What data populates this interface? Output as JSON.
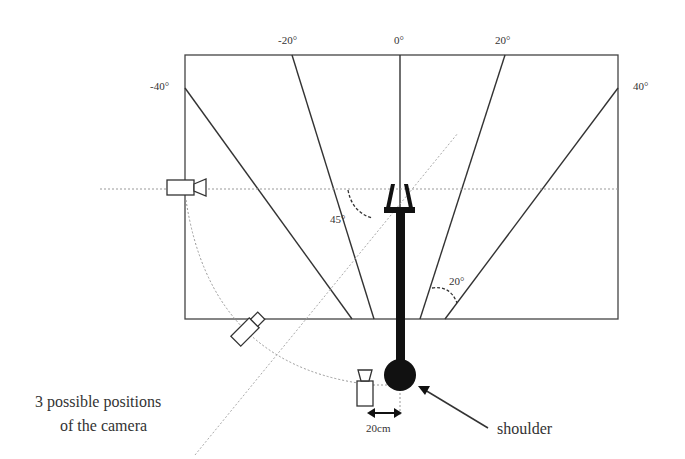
{
  "figure": {
    "angle_labels": {
      "minus40": "-40°",
      "minus20": "-20°",
      "zero": "0°",
      "plus20": "20°",
      "plus40": "40°"
    },
    "angle_annotations": {
      "camera_axis": "45°",
      "sector_spacing": "20°"
    },
    "caption_camera_line1": "3 possible positions",
    "caption_camera_line2": "of the camera",
    "distance_label": "20cm",
    "shoulder_label": "shoulder"
  }
}
